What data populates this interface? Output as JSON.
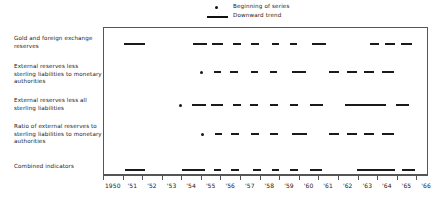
{
  "legend": {
    "items": [
      {
        "label": "Beginning of series",
        "marker": "dot-marker-icon"
      },
      {
        "label": "Downward trend",
        "marker": "line-marker-icon"
      }
    ]
  },
  "rows": [
    {
      "label": "Gold and foreign exchange reserves"
    },
    {
      "label": "External reserves less sterling liabilities to monetary authorities"
    },
    {
      "label": "External reserves less all sterling liabilities"
    },
    {
      "label": "Ratio of external reserves to sterling liabilities to monetary authorities"
    },
    {
      "label": "Combined indicators"
    }
  ],
  "axis": {
    "tick_labels": [
      "1950",
      "'51",
      "'52",
      "'53",
      "'54",
      "'55",
      "'56",
      "'57",
      "'58",
      "'59",
      "'60",
      "'61",
      "'62",
      "'63",
      "'64",
      "'65",
      "'66"
    ]
  },
  "chart_data": {
    "type": "timeline",
    "title": "",
    "subtitle": "",
    "xlabel": "",
    "ylabel": "",
    "xlim": [
      1950,
      1966.6
    ],
    "grid": false,
    "legend_position": "top-center",
    "x_ticks": [
      1950,
      1951,
      1952,
      1953,
      1954,
      1955,
      1956,
      1957,
      1958,
      1959,
      1960,
      1961,
      1962,
      1963,
      1964,
      1965,
      1966
    ],
    "x_tick_labels": [
      "1950",
      "'51",
      "'52",
      "'53",
      "'54",
      "'55",
      "'56",
      "'57",
      "'58",
      "'59",
      "'60",
      "'61",
      "'62",
      "'63",
      "'64",
      "'65",
      "'66"
    ],
    "series": [
      {
        "name": "Gold and foreign exchange reserves",
        "start_marker": null,
        "segments": [
          [
            1951.0,
            1952.1
          ],
          [
            1954.55,
            1955.25
          ],
          [
            1955.5,
            1956.1
          ],
          [
            1956.6,
            1957.0
          ],
          [
            1957.5,
            1957.9
          ],
          [
            1958.6,
            1958.95
          ],
          [
            1959.5,
            1959.85
          ],
          [
            1960.6,
            1961.35
          ],
          [
            1963.6,
            1964.05
          ],
          [
            1964.35,
            1964.85
          ],
          [
            1965.15,
            1965.75
          ]
        ]
      },
      {
        "name": "External reserves less sterling liabilities to monetary authorities",
        "start_marker": 1955.0,
        "segments": [
          [
            1955.6,
            1956.0
          ],
          [
            1956.45,
            1956.85
          ],
          [
            1957.5,
            1957.85
          ],
          [
            1958.5,
            1958.85
          ],
          [
            1959.6,
            1960.3
          ],
          [
            1961.5,
            1962.0
          ],
          [
            1962.4,
            1962.9
          ],
          [
            1963.3,
            1963.8
          ],
          [
            1964.2,
            1964.8
          ]
        ]
      },
      {
        "name": "External reserves less all sterling liabilities",
        "start_marker": 1953.9,
        "segments": [
          [
            1954.5,
            1955.2
          ],
          [
            1955.45,
            1956.1
          ],
          [
            1956.6,
            1957.0
          ],
          [
            1957.45,
            1957.85
          ],
          [
            1958.5,
            1958.9
          ],
          [
            1959.5,
            1959.9
          ],
          [
            1960.5,
            1961.2
          ],
          [
            1962.3,
            1964.4
          ],
          [
            1964.9,
            1965.6
          ]
        ]
      },
      {
        "name": "Ratio of external reserves to sterling liabilities to monetary authorities",
        "start_marker": 1955.05,
        "segments": [
          [
            1955.65,
            1956.05
          ],
          [
            1956.5,
            1956.9
          ],
          [
            1957.5,
            1957.9
          ],
          [
            1958.5,
            1958.9
          ],
          [
            1959.6,
            1960.35
          ],
          [
            1961.5,
            1962.0
          ],
          [
            1962.4,
            1962.9
          ],
          [
            1963.3,
            1963.8
          ],
          [
            1964.2,
            1964.8
          ]
        ]
      },
      {
        "name": "Combined indicators",
        "start_marker": null,
        "segments": [
          [
            1951.05,
            1952.1
          ],
          [
            1954.0,
            1955.15
          ],
          [
            1955.6,
            1956.0
          ],
          [
            1956.5,
            1956.9
          ],
          [
            1957.6,
            1958.0
          ],
          [
            1958.6,
            1958.95
          ],
          [
            1959.5,
            1959.9
          ],
          [
            1960.5,
            1961.15
          ],
          [
            1962.9,
            1964.85
          ],
          [
            1965.2,
            1965.9
          ]
        ]
      }
    ]
  }
}
